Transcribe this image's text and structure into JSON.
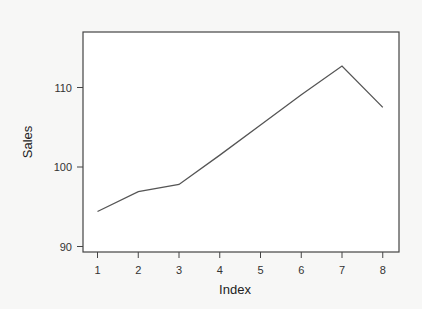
{
  "chart_data": {
    "type": "line",
    "title": "",
    "xlabel": "Index",
    "ylabel": "Sales",
    "x": [
      1,
      2,
      3,
      4,
      5,
      6,
      7,
      8
    ],
    "series": [
      {
        "name": "Sales",
        "values": [
          94.4,
          96.9,
          97.8,
          101.5,
          105.3,
          109.1,
          112.7,
          107.5
        ],
        "color": "#555555"
      }
    ],
    "xticks": [
      "1",
      "2",
      "3",
      "4",
      "5",
      "6",
      "7",
      "8"
    ],
    "yticks": [
      "90",
      "100",
      "110"
    ],
    "xlim": [
      0.65,
      8.4
    ],
    "ylim": [
      89.4,
      116.9
    ],
    "grid": false,
    "legend": "none"
  },
  "colors": {
    "background": "#f7f7f6",
    "axis": "#444444",
    "line": "#555555",
    "text": "#333333"
  }
}
